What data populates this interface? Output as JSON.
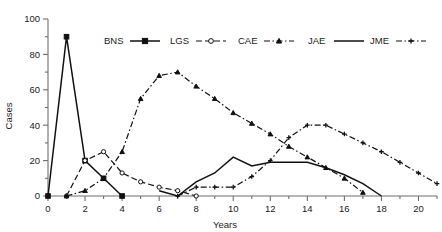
{
  "chart_data": {
    "type": "line",
    "title": "",
    "xlabel": "Years",
    "ylabel": "Cases",
    "xlim": [
      0,
      21
    ],
    "ylim": [
      0,
      100
    ],
    "grid": false,
    "legend_position": "top-center",
    "x_major_ticks": [
      0,
      2,
      4,
      6,
      8,
      10,
      12,
      14,
      16,
      18,
      20
    ],
    "x_minor_ticks": [
      1,
      3,
      5,
      7,
      9,
      11,
      13,
      15,
      17,
      19,
      21
    ],
    "x_tick_labels": [
      "0",
      "2",
      "4",
      "6",
      "8",
      "10",
      "12",
      "14",
      "16",
      "18",
      "20"
    ],
    "y_major_ticks": [
      0,
      20,
      40,
      60,
      80,
      100
    ],
    "y_minor_ticks": [
      10,
      30,
      50,
      70,
      90
    ],
    "y_tick_labels": [
      "0",
      "20",
      "40",
      "60",
      "80",
      "100"
    ],
    "x": [
      0,
      1,
      2,
      3,
      4,
      5,
      6,
      7,
      8,
      9,
      10,
      11,
      12,
      13,
      14,
      15,
      16,
      17,
      18,
      19,
      20,
      21
    ],
    "series": [
      {
        "name": "BNS",
        "style": "solid",
        "marker": "square",
        "x": [
          0,
          1,
          2,
          3,
          4
        ],
        "values": [
          0,
          90,
          20,
          10,
          0
        ]
      },
      {
        "name": "LGS",
        "style": "dashed",
        "marker": "circle-open",
        "x": [
          1,
          2,
          3,
          4,
          5,
          6,
          7,
          8
        ],
        "values": [
          0,
          20,
          25,
          13,
          8,
          5,
          3,
          0
        ]
      },
      {
        "name": "CAE",
        "style": "dash-dot",
        "marker": "triangle",
        "x": [
          1,
          2,
          3,
          4,
          5,
          6,
          7,
          8,
          9,
          10,
          11,
          12,
          13,
          14,
          15,
          16,
          17
        ],
        "values": [
          0,
          3,
          10,
          25,
          55,
          68,
          70,
          62,
          55,
          47,
          41,
          35,
          28,
          22,
          16,
          10,
          2
        ]
      },
      {
        "name": "JAE",
        "style": "solid",
        "marker": "none",
        "x": [
          6,
          7,
          8,
          9,
          10,
          11,
          12,
          13,
          14,
          15,
          16,
          17,
          18
        ],
        "values": [
          3,
          0,
          8,
          13,
          22,
          17,
          19,
          19,
          19,
          16,
          12,
          7,
          0
        ]
      },
      {
        "name": "JME",
        "style": "dash-dot",
        "marker": "plus",
        "x": [
          7,
          8,
          9,
          10,
          11,
          12,
          13,
          14,
          15,
          16,
          17,
          18,
          19,
          20,
          21
        ],
        "values": [
          0,
          5,
          5,
          5,
          11,
          20,
          33,
          40,
          40,
          35,
          30,
          25,
          19,
          13,
          7
        ]
      }
    ],
    "legend": [
      {
        "label": "BNS",
        "style": "solid",
        "marker": "square"
      },
      {
        "label": "LGS",
        "style": "dashed",
        "marker": "circle-open"
      },
      {
        "label": "CAE",
        "style": "dash-dot",
        "marker": "triangle"
      },
      {
        "label": "JAE",
        "style": "solid",
        "marker": "none"
      },
      {
        "label": "JME",
        "style": "dash-dot",
        "marker": "plus"
      }
    ]
  }
}
